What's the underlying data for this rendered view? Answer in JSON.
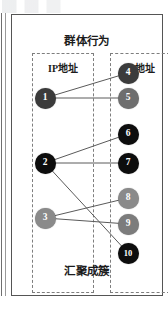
{
  "figure": {
    "title": "群体行为",
    "caption": "汇聚成簇",
    "groups": [
      {
        "name": "left-ip-group",
        "label": "IP地址"
      },
      {
        "name": "right-ip-group",
        "label": "IP地址"
      }
    ]
  },
  "chart_data": {
    "type": "diagram",
    "title": "群体行为",
    "caption": "汇聚成簇",
    "layout": "bipartite-graph",
    "groups": [
      "IP地址",
      "IP地址"
    ],
    "nodes": [
      {
        "id": "1",
        "label": "1",
        "side": "left",
        "x": 45,
        "y": 98,
        "color": "#3b3b3b"
      },
      {
        "id": "2",
        "label": "2",
        "side": "left",
        "x": 45,
        "y": 163,
        "color": "#0d0d0d"
      },
      {
        "id": "3",
        "label": "3",
        "side": "left",
        "x": 45,
        "y": 218,
        "color": "#8a8a8a"
      },
      {
        "id": "4",
        "label": "4",
        "side": "right",
        "x": 128,
        "y": 73,
        "color": "#3b3b3b"
      },
      {
        "id": "5",
        "label": "5",
        "side": "right",
        "x": 128,
        "y": 98,
        "color": "#6e6e6e"
      },
      {
        "id": "6",
        "label": "6",
        "side": "right",
        "x": 128,
        "y": 134,
        "color": "#0d0d0d"
      },
      {
        "id": "7",
        "label": "7",
        "side": "right",
        "x": 128,
        "y": 163,
        "color": "#0d0d0d"
      },
      {
        "id": "8",
        "label": "8",
        "side": "right",
        "x": 128,
        "y": 198,
        "color": "#8a8a8a"
      },
      {
        "id": "9",
        "label": "9",
        "side": "right",
        "x": 128,
        "y": 224,
        "color": "#7c7c7c"
      },
      {
        "id": "10",
        "label": "10",
        "side": "right",
        "x": 128,
        "y": 253,
        "color": "#0d0d0d"
      }
    ],
    "edges": [
      {
        "from": "1",
        "to": "4"
      },
      {
        "from": "1",
        "to": "5"
      },
      {
        "from": "2",
        "to": "6"
      },
      {
        "from": "2",
        "to": "7"
      },
      {
        "from": "2",
        "to": "10"
      },
      {
        "from": "3",
        "to": "8"
      },
      {
        "from": "3",
        "to": "9"
      }
    ],
    "edge_color": "#5a5a5a",
    "frame_color": "#555555",
    "dashed_box_color": "#7e7e7e",
    "background": "#ffffff"
  }
}
